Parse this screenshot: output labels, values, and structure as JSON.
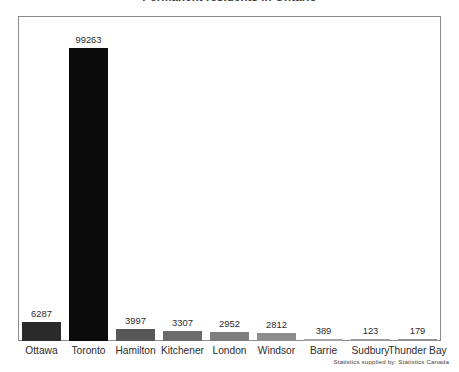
{
  "chart_data": {
    "type": "bar",
    "title": "Permanent residents in Ontario",
    "xlabel": "",
    "ylabel": "",
    "ylim": [
      0,
      110000
    ],
    "grid": false,
    "legend": null,
    "source_note": "Statistics supplied by: Statistics Canada",
    "categories": [
      "Ottawa",
      "Toronto",
      "Hamilton",
      "Kitchener",
      "London",
      "Windsor",
      "Barrie",
      "Sudbury",
      "Thunder Bay"
    ],
    "values": [
      6287,
      99263,
      3997,
      3307,
      2952,
      2812,
      389,
      123,
      179
    ],
    "value_labels": [
      "6287",
      "99263",
      "3997",
      "3307",
      "2952",
      "2812",
      "389",
      "123",
      "179"
    ],
    "bar_colors": [
      "#2a2a2a",
      "#0b0b0b",
      "#575757",
      "#6b6b6b",
      "#7e7e7e",
      "#8d8d8d",
      "#a5a5a5",
      "#9a9a9a",
      "#909090"
    ]
  },
  "frame": {
    "border_color": "#8c8c8c"
  }
}
